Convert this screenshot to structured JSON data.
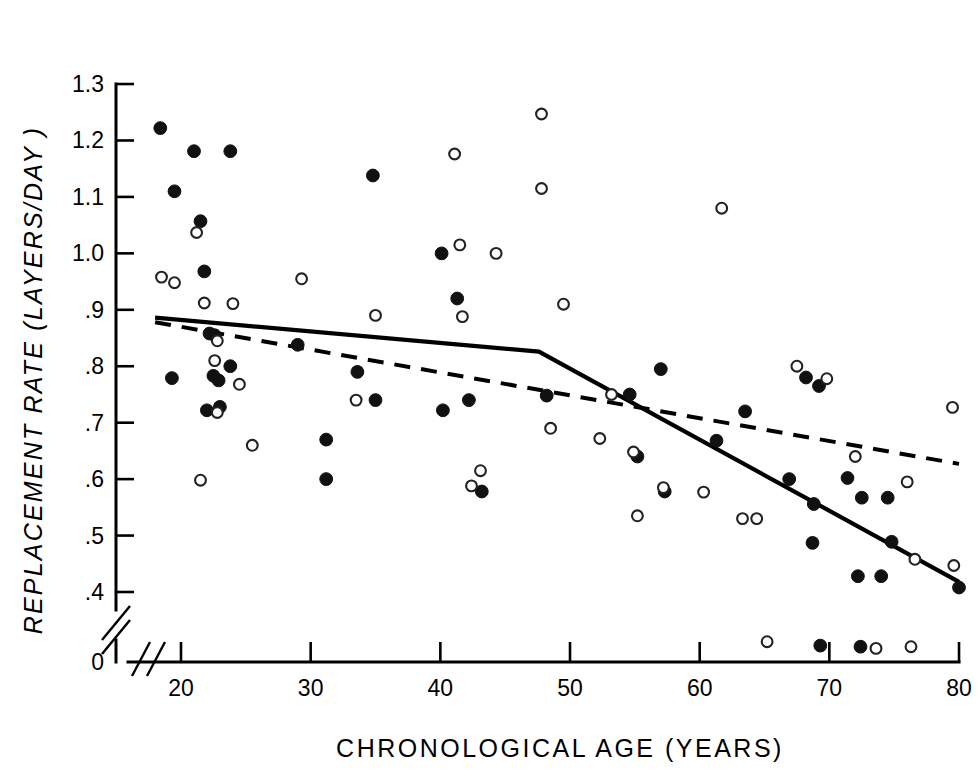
{
  "figure": {
    "title": "",
    "caption": ""
  },
  "axes": {
    "y_title": "REPLACEMENT RATE (LAYERS/DAY )",
    "x_title": "CHRONOLOGICAL AGE (YEARS)",
    "y_ticks": [
      "1.3",
      "1.2",
      "1.1",
      "1.0",
      ".9",
      ".8",
      ".7",
      ".6",
      ".5",
      ".4",
      "0"
    ],
    "x_ticks": [
      "20",
      "30",
      "40",
      "50",
      "60",
      "70",
      "80"
    ],
    "y_axis_break": true,
    "x_axis_break": true
  },
  "chart_data": {
    "type": "scatter",
    "title": "",
    "xlabel": "CHRONOLOGICAL AGE (YEARS)",
    "ylabel": "REPLACEMENT RATE (LAYERS/DAY )",
    "xlim": [
      18,
      80
    ],
    "ylim": [
      0.4,
      1.3
    ],
    "y_break_below": 0.4,
    "xticks": [
      20,
      30,
      40,
      50,
      60,
      70,
      80
    ],
    "yticks": [
      0.4,
      0.5,
      0.6,
      0.7,
      0.8,
      0.9,
      1.0,
      1.1,
      1.2,
      1.3
    ],
    "grid": false,
    "legend": null,
    "colors": {
      "marker": "#111111",
      "line": "#000000",
      "background": "#ffffff"
    },
    "series": [
      {
        "name": "filled",
        "marker": "filled-circle",
        "points": [
          [
            18.4,
            1.222
          ],
          [
            21.0,
            1.181
          ],
          [
            23.8,
            1.181
          ],
          [
            19.5,
            1.11
          ],
          [
            21.5,
            1.057
          ],
          [
            34.8,
            1.138
          ],
          [
            21.8,
            0.968
          ],
          [
            40.1,
            1.0
          ],
          [
            41.3,
            0.92
          ],
          [
            22.2,
            0.858
          ],
          [
            22.6,
            0.855
          ],
          [
            29.0,
            0.838
          ],
          [
            19.3,
            0.779
          ],
          [
            22.5,
            0.783
          ],
          [
            22.9,
            0.775
          ],
          [
            23.8,
            0.8
          ],
          [
            22.0,
            0.722
          ],
          [
            23.0,
            0.728
          ],
          [
            33.6,
            0.79
          ],
          [
            35.0,
            0.74
          ],
          [
            40.2,
            0.722
          ],
          [
            42.2,
            0.74
          ],
          [
            31.2,
            0.67
          ],
          [
            31.2,
            0.6
          ],
          [
            43.2,
            0.578
          ],
          [
            48.2,
            0.748
          ],
          [
            54.6,
            0.75
          ],
          [
            55.2,
            0.64
          ],
          [
            57.0,
            0.795
          ],
          [
            57.3,
            0.578
          ],
          [
            63.5,
            0.72
          ],
          [
            61.3,
            0.668
          ],
          [
            68.2,
            0.78
          ],
          [
            69.2,
            0.765
          ],
          [
            66.9,
            0.6
          ],
          [
            68.8,
            0.556
          ],
          [
            71.4,
            0.602
          ],
          [
            72.5,
            0.567
          ],
          [
            74.5,
            0.567
          ],
          [
            68.7,
            0.487
          ],
          [
            74.8,
            0.489
          ],
          [
            72.2,
            0.428
          ],
          [
            74.0,
            0.428
          ],
          [
            80.0,
            0.408
          ],
          [
            69.3,
            0.305
          ],
          [
            72.4,
            0.303
          ]
        ]
      },
      {
        "name": "open",
        "marker": "open-circle",
        "points": [
          [
            47.8,
            1.247
          ],
          [
            41.1,
            1.176
          ],
          [
            47.8,
            1.115
          ],
          [
            61.7,
            1.08
          ],
          [
            21.2,
            1.037
          ],
          [
            18.5,
            0.958
          ],
          [
            19.5,
            0.948
          ],
          [
            21.8,
            0.912
          ],
          [
            24.0,
            0.911
          ],
          [
            29.3,
            0.955
          ],
          [
            41.5,
            1.015
          ],
          [
            44.3,
            1.0
          ],
          [
            35.0,
            0.89
          ],
          [
            41.7,
            0.888
          ],
          [
            49.5,
            0.91
          ],
          [
            22.8,
            0.845
          ],
          [
            22.6,
            0.81
          ],
          [
            24.5,
            0.768
          ],
          [
            33.5,
            0.74
          ],
          [
            22.8,
            0.718
          ],
          [
            25.5,
            0.66
          ],
          [
            21.5,
            0.598
          ],
          [
            42.4,
            0.588
          ],
          [
            43.1,
            0.615
          ],
          [
            48.5,
            0.69
          ],
          [
            52.3,
            0.672
          ],
          [
            54.9,
            0.648
          ],
          [
            57.2,
            0.585
          ],
          [
            55.2,
            0.535
          ],
          [
            60.3,
            0.577
          ],
          [
            63.3,
            0.53
          ],
          [
            64.4,
            0.53
          ],
          [
            53.2,
            0.75
          ],
          [
            67.5,
            0.8
          ],
          [
            69.8,
            0.778
          ],
          [
            72.0,
            0.64
          ],
          [
            76.0,
            0.595
          ],
          [
            79.5,
            0.727
          ],
          [
            76.6,
            0.458
          ],
          [
            79.6,
            0.447
          ],
          [
            65.2,
            0.312
          ],
          [
            73.6,
            0.3
          ],
          [
            76.3,
            0.303
          ]
        ]
      }
    ],
    "fit_lines": [
      {
        "name": "solid-segmented-fit",
        "style": "solid",
        "points": [
          [
            18.0,
            0.886
          ],
          [
            47.6,
            0.826
          ],
          [
            80.0,
            0.418
          ]
        ]
      },
      {
        "name": "dashed-linear-fit",
        "style": "dashed",
        "points": [
          [
            18.0,
            0.878
          ],
          [
            80.0,
            0.627
          ]
        ]
      }
    ]
  }
}
